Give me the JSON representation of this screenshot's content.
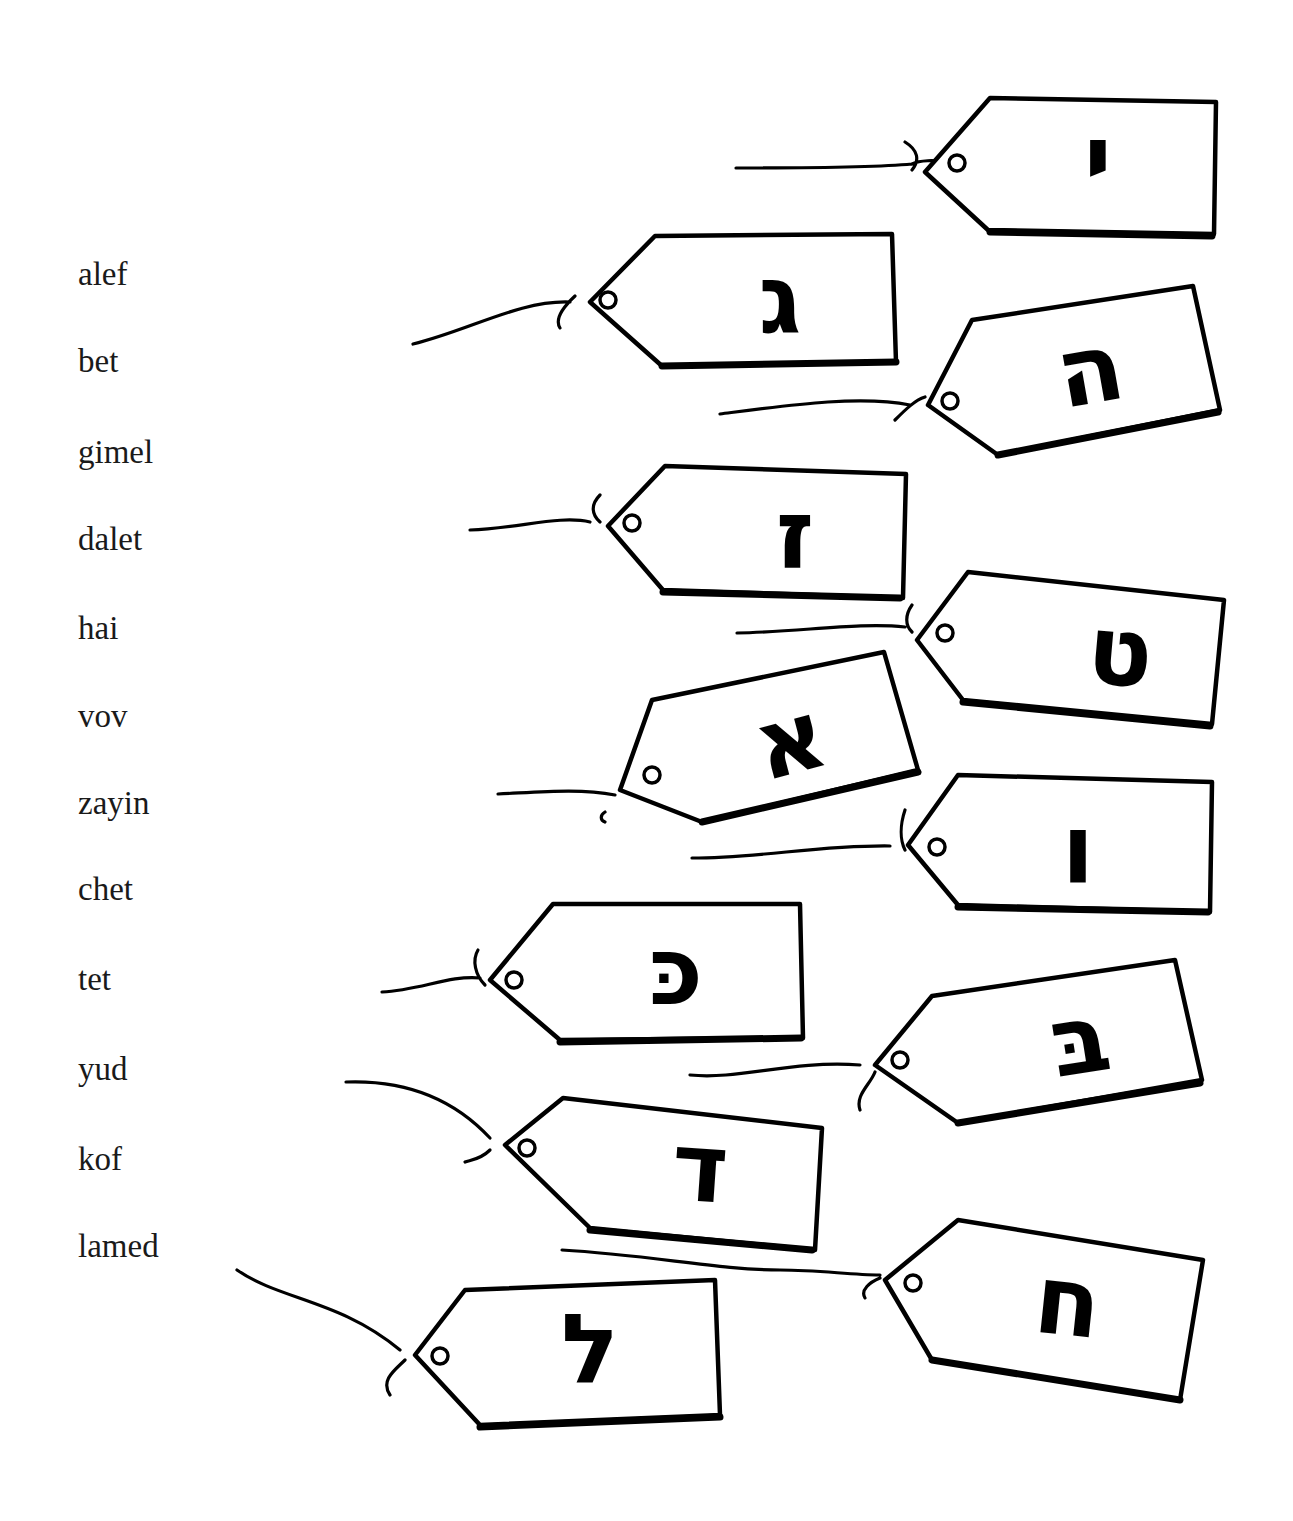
{
  "word_list": [
    {
      "label": "alef",
      "top": 258
    },
    {
      "label": "bet",
      "top": 345
    },
    {
      "label": "gimel",
      "top": 436
    },
    {
      "label": "dalet",
      "top": 523
    },
    {
      "label": "hai",
      "top": 612
    },
    {
      "label": "vov",
      "top": 700
    },
    {
      "label": "zayin",
      "top": 787
    },
    {
      "label": "chet",
      "top": 873
    },
    {
      "label": "tet",
      "top": 963
    },
    {
      "label": "yud",
      "top": 1053
    },
    {
      "label": "kof",
      "top": 1143
    },
    {
      "label": "lamed",
      "top": 1230
    }
  ],
  "tags": [
    {
      "name": "yud",
      "letter": "י"
    },
    {
      "name": "gimel",
      "letter": "ג"
    },
    {
      "name": "hai",
      "letter": "ה"
    },
    {
      "name": "zayin",
      "letter": "ז"
    },
    {
      "name": "tet",
      "letter": "ט"
    },
    {
      "name": "alef",
      "letter": "א"
    },
    {
      "name": "vov",
      "letter": "ו"
    },
    {
      "name": "kof",
      "letter": "כּ"
    },
    {
      "name": "bet",
      "letter": "בּ"
    },
    {
      "name": "dalet",
      "letter": "ד"
    },
    {
      "name": "chet",
      "letter": "ח"
    },
    {
      "name": "lamed",
      "letter": "ל"
    }
  ]
}
